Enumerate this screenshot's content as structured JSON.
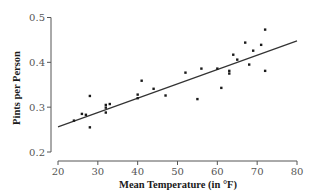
{
  "chart_data": {
    "type": "scatter",
    "title": "",
    "xlabel": "Mean Temperature (in °F)",
    "ylabel": "Pints per Person",
    "xlim": [
      20,
      80
    ],
    "ylim": [
      0.2,
      0.5
    ],
    "xticks": [
      20,
      30,
      40,
      50,
      60,
      70,
      80
    ],
    "xtick_labels": [
      "20",
      "30",
      "40",
      "50",
      "60",
      "70",
      "80"
    ],
    "yticks": [
      0.2,
      0.3,
      0.4,
      0.5
    ],
    "ytick_labels": [
      "0.2",
      "0.3",
      "0.4",
      "0.5"
    ],
    "grid": false,
    "legend": "none",
    "series": [
      {
        "name": "observations",
        "points": [
          {
            "x": 24,
            "y": 0.27
          },
          {
            "x": 26,
            "y": 0.285
          },
          {
            "x": 27,
            "y": 0.283
          },
          {
            "x": 28,
            "y": 0.325
          },
          {
            "x": 28,
            "y": 0.255
          },
          {
            "x": 32,
            "y": 0.305
          },
          {
            "x": 32,
            "y": 0.299
          },
          {
            "x": 32,
            "y": 0.288
          },
          {
            "x": 33,
            "y": 0.307
          },
          {
            "x": 40,
            "y": 0.328
          },
          {
            "x": 40,
            "y": 0.32
          },
          {
            "x": 41,
            "y": 0.359
          },
          {
            "x": 44,
            "y": 0.341
          },
          {
            "x": 47,
            "y": 0.326
          },
          {
            "x": 52,
            "y": 0.377
          },
          {
            "x": 55,
            "y": 0.318
          },
          {
            "x": 56,
            "y": 0.386
          },
          {
            "x": 60,
            "y": 0.386
          },
          {
            "x": 61,
            "y": 0.343
          },
          {
            "x": 63,
            "y": 0.381
          },
          {
            "x": 63,
            "y": 0.375
          },
          {
            "x": 64,
            "y": 0.417
          },
          {
            "x": 65,
            "y": 0.406
          },
          {
            "x": 67,
            "y": 0.444
          },
          {
            "x": 68,
            "y": 0.395
          },
          {
            "x": 69,
            "y": 0.426
          },
          {
            "x": 71,
            "y": 0.439
          },
          {
            "x": 72,
            "y": 0.473
          },
          {
            "x": 72,
            "y": 0.381
          }
        ]
      }
    ],
    "fit_line": {
      "name": "least-squares regression line",
      "x": [
        20,
        80
      ],
      "y": [
        0.256,
        0.448
      ]
    }
  }
}
